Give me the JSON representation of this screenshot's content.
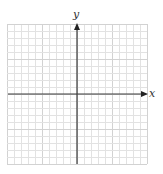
{
  "diagram": {
    "type": "cartesian-coordinate-grid",
    "axes": {
      "x_label": "x",
      "y_label": "y"
    },
    "grid": {
      "columns": 20,
      "rows": 20,
      "cell_size_px": 7,
      "line_color": "#e2e2e2",
      "major_line_color": "#d2d2d2",
      "major_every": 5
    },
    "colors": {
      "axis": "#3a3a3a",
      "label": "#333333",
      "background": "#ffffff"
    }
  }
}
